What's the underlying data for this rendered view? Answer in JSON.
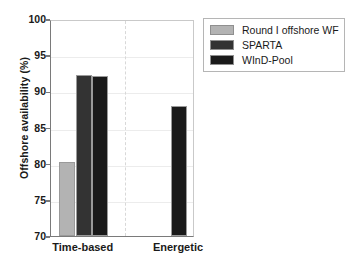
{
  "chart_data": {
    "type": "bar",
    "title": "",
    "xlabel": "",
    "ylabel": "Offshore availability (%)",
    "ylim": [
      70,
      100
    ],
    "yticks": [
      70,
      75,
      80,
      85,
      90,
      95,
      100
    ],
    "ytick_labels": [
      "70",
      "75",
      "80",
      "85",
      "90",
      "95",
      "100"
    ],
    "categories": [
      "Time-based",
      "Energetic"
    ],
    "grid": true,
    "legend_position": "upper right",
    "series": [
      {
        "name": "Round I offshore WF",
        "color": "#b3b3b3",
        "values": [
          80.3,
          null
        ]
      },
      {
        "name": "SPARTA",
        "color": "#333333",
        "values": [
          92.3,
          null
        ]
      },
      {
        "name": "WInD-Pool",
        "color": "#1a1a1a",
        "values": [
          92.1,
          88.0
        ]
      }
    ]
  },
  "axes": {
    "y_title": "Offshore availability (%)",
    "y_tick_labels": [
      "100",
      "95",
      "90",
      "85",
      "80",
      "75",
      "70"
    ],
    "x_tick_labels": [
      "Time-based",
      "Energetic"
    ]
  },
  "legend": {
    "entries": [
      {
        "label": "Round I offshore WF",
        "color": "#b3b3b3"
      },
      {
        "label": "SPARTA",
        "color": "#333333"
      },
      {
        "label": "WInD-Pool",
        "color": "#1a1a1a"
      }
    ]
  },
  "colors": {
    "round_i": "#b3b3b3",
    "sparta": "#333333",
    "wind_pool": "#1a1a1a",
    "axis": "#7a7a7a",
    "grid": "#ececec",
    "divider": "#d8d8d8",
    "background": "#ffffff"
  }
}
